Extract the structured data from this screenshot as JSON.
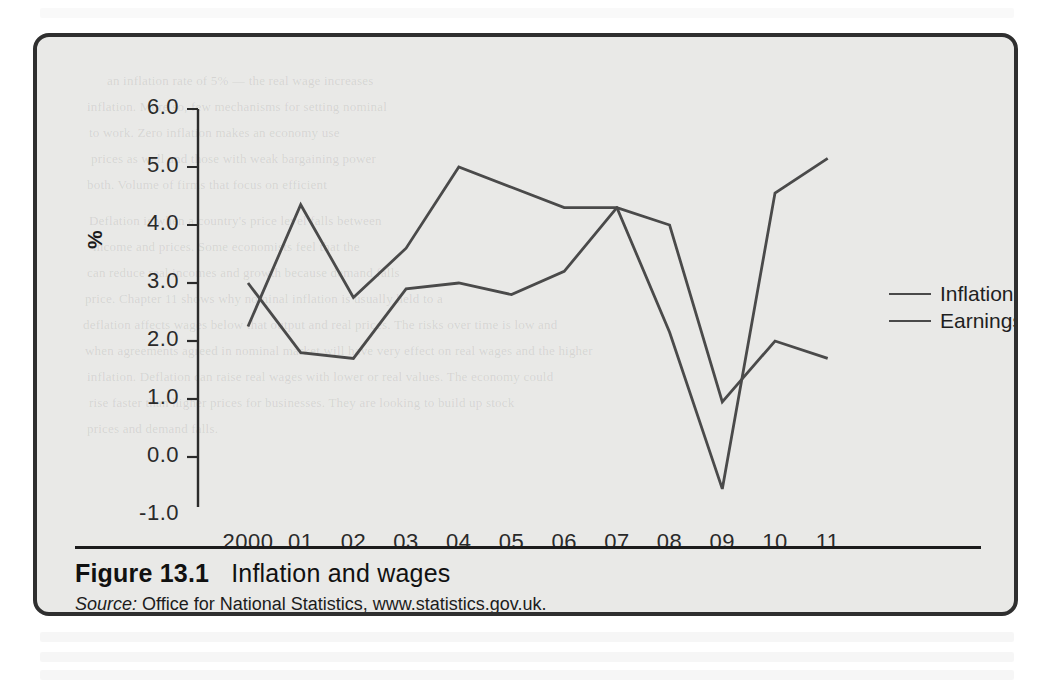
{
  "figure": {
    "number": "Figure 13.1",
    "title": "Inflation and wages",
    "source_label": "Source:",
    "source_text": "Office for National Statistics, www.statistics.gov.uk."
  },
  "chart_data": {
    "type": "line",
    "title": "Inflation and wages",
    "xlabel": "",
    "ylabel": "%",
    "categories": [
      "2000",
      "01",
      "02",
      "03",
      "04",
      "05",
      "06",
      "07",
      "08",
      "09",
      "10",
      "11"
    ],
    "x_tick_labels": [
      "2000",
      "01",
      "02",
      "03",
      "04",
      "05",
      "06",
      "07",
      "08",
      "09",
      "10",
      "11"
    ],
    "y_tick_labels": [
      "6.0",
      "5.0",
      "4.0",
      "3.0",
      "2.0",
      "1.0",
      "0.0",
      "-1.0"
    ],
    "y_tick_values": [
      6.0,
      5.0,
      4.0,
      3.0,
      2.0,
      1.0,
      0.0,
      -1.0
    ],
    "ylim": [
      -1.0,
      6.0
    ],
    "grid": false,
    "legend_position": "right",
    "series": [
      {
        "name": "Inflation",
        "color": "#4a4a4a",
        "values": [
          3.0,
          1.8,
          1.7,
          2.9,
          3.0,
          2.8,
          3.2,
          4.3,
          4.0,
          0.95,
          2.0,
          1.7
        ]
      },
      {
        "name": "Earnings",
        "color": "#4a4a4a",
        "values": [
          2.25,
          4.35,
          2.75,
          3.6,
          5.0,
          4.65,
          4.3,
          4.3,
          2.15,
          -0.55,
          4.55,
          5.15
        ]
      }
    ]
  },
  "ghost_text": [
    "an inflation rate of 5% — the real wage increases",
    "inflation. More so, few mechanisms for setting nominal",
    "to work. Zero inflation makes an economy use",
    "prices as well and those with weak bargaining power",
    "both. Volume of firms that focus on efficient",
    "Deflation is when a country's price level falls between",
    "income and prices. Some economists feel that the",
    "can reduce real incomes and growth because demand falls",
    "price. Chapter 11 shows why nominal inflation is usually held to a",
    "deflation affects wages below that output and real prices. The risks over time is low and",
    "when agreements agreed in nominal market will have very effect on real wages and the higher",
    "inflation. Deflation can raise real wages with lower or real values. The economy could",
    "rise faster than higher prices for businesses. They are looking to build up stock",
    "prices and demand falls."
  ]
}
